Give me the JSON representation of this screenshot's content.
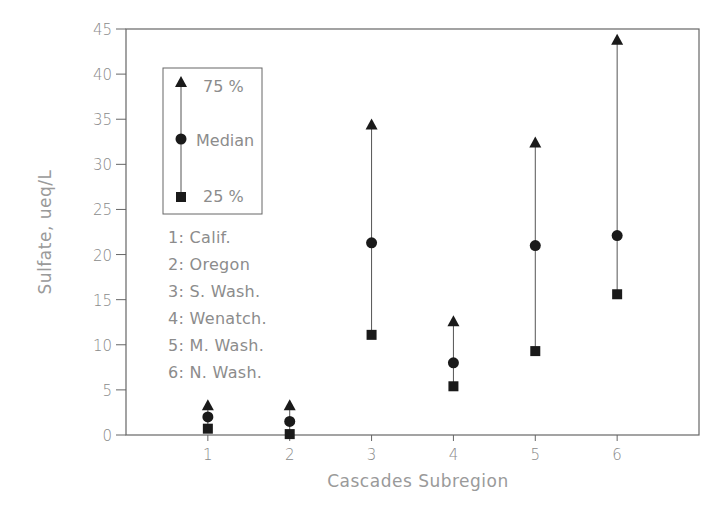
{
  "chart_data": {
    "type": "scatter",
    "subtype": "range-plot (25th percentile, median, 75th percentile)",
    "title": "",
    "xlabel": "Cascades Subregion",
    "ylabel": "Sulfate, ueq/L",
    "xlim": [
      0,
      7
    ],
    "ylim": [
      0,
      45
    ],
    "x_ticks": [
      1,
      2,
      3,
      4,
      5,
      6
    ],
    "y_ticks": [
      0,
      5,
      10,
      15,
      20,
      25,
      30,
      35,
      40,
      45
    ],
    "grid": false,
    "legend_position": "upper-left inside plot",
    "categories": [
      "1",
      "2",
      "3",
      "4",
      "5",
      "6"
    ],
    "series": [
      {
        "name": "75 %",
        "marker": "triangle",
        "values": [
          3.2,
          3.2,
          34.3,
          12.5,
          32.3,
          43.7
        ]
      },
      {
        "name": "Median",
        "marker": "circle",
        "values": [
          2.0,
          1.5,
          21.3,
          8.0,
          21.0,
          22.1
        ]
      },
      {
        "name": "25 %",
        "marker": "square",
        "values": [
          0.7,
          0.1,
          11.1,
          5.4,
          9.3,
          15.6
        ]
      }
    ],
    "annotations": [
      "1: Calif.",
      "2: Oregon",
      "3: S. Wash.",
      "4: Wenatch.",
      "5: M. Wash.",
      "6: N. Wash."
    ]
  },
  "legend": {
    "items": [
      {
        "label": "75 %",
        "marker": "triangle"
      },
      {
        "label": "Median",
        "marker": "circle"
      },
      {
        "label": "25 %",
        "marker": "square"
      }
    ]
  },
  "region_key": [
    "1: Calif.",
    "2: Oregon",
    "3: S. Wash.",
    "4: Wenatch.",
    "5: M. Wash.",
    "6: N. Wash."
  ],
  "colors": {
    "marker": "#1a1a1a",
    "line": "#555555",
    "frame": "#666666",
    "text": "#8c8c8c"
  }
}
